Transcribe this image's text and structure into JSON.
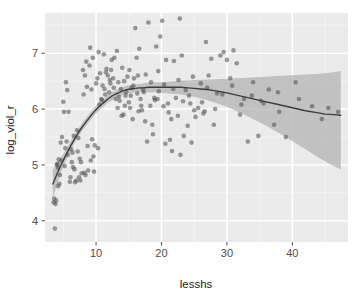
{
  "chart_data": {
    "type": "scatter",
    "title": "",
    "subtitle": "",
    "xlabel": "lesshs",
    "ylabel": "log_viol_r",
    "xlim": [
      2.2,
      48.5
    ],
    "ylim": [
      3.62,
      7.72
    ],
    "xticks": [
      10,
      20,
      30,
      40
    ],
    "xtick_labels": [
      "10",
      "20",
      "30",
      "40"
    ],
    "yticks": [
      4,
      5,
      6,
      7
    ],
    "ytick_labels": [
      "4",
      "5",
      "6",
      "7"
    ],
    "grid": true,
    "grid_major_color": "#ffffff",
    "grid_minor_color": "#f4f4f4",
    "panel_background": "#ebebeb",
    "legend": "none",
    "point_color": "#4d4d4d",
    "point_opacity": 0.55,
    "point_radius": 2.3,
    "smooth_line_color": "#3d3d3d",
    "smooth_band_color": "#b3b3b3",
    "smooth_band_opacity": 0.75,
    "series": [
      {
        "name": "observations",
        "x": [
          3.5,
          3.6,
          3.7,
          3.8,
          3.9,
          4.0,
          4.1,
          4.2,
          4.3,
          4.4,
          4.5,
          4.6,
          4.8,
          5.0,
          5.1,
          5.3,
          5.5,
          5.6,
          5.8,
          6.0,
          6.1,
          6.3,
          6.5,
          6.6,
          6.8,
          7.0,
          7.1,
          7.3,
          7.5,
          7.6,
          7.8,
          8.0,
          8.1,
          8.3,
          8.5,
          8.6,
          8.8,
          9.0,
          9.1,
          9.3,
          9.5,
          9.6,
          9.8,
          10.0,
          10.2,
          10.4,
          10.6,
          10.8,
          11.0,
          11.2,
          11.4,
          11.6,
          11.8,
          12.0,
          12.2,
          12.4,
          12.6,
          12.8,
          13.0,
          13.2,
          13.4,
          13.6,
          13.8,
          14.0,
          14.2,
          14.4,
          14.6,
          14.8,
          15.0,
          15.2,
          15.4,
          15.6,
          15.8,
          16.0,
          16.2,
          16.4,
          16.6,
          16.8,
          17.0,
          17.2,
          17.5,
          17.8,
          18.0,
          18.3,
          18.6,
          18.9,
          19.2,
          19.5,
          19.8,
          20.1,
          20.4,
          20.7,
          21.0,
          21.3,
          21.6,
          21.9,
          22.2,
          22.5,
          22.8,
          23.1,
          23.4,
          23.7,
          24.0,
          24.4,
          24.8,
          25.2,
          25.6,
          26.0,
          26.4,
          26.8,
          27.2,
          27.6,
          28.0,
          28.5,
          29.0,
          29.5,
          30.0,
          30.5,
          31.0,
          31.5,
          32.0,
          32.6,
          33.2,
          34.0,
          34.8,
          35.6,
          36.4,
          37.2,
          38.0,
          39.0,
          40.5,
          41.0,
          44.5,
          45.5,
          47.0,
          4.2,
          4.7,
          5.2,
          5.7,
          6.2,
          6.7,
          7.2,
          7.7,
          8.2,
          8.7,
          9.2,
          9.7,
          10.3,
          10.9,
          11.5,
          12.1,
          12.7,
          13.3,
          13.9,
          14.5,
          15.1,
          15.7,
          16.3,
          16.9,
          17.6,
          18.4,
          19.0,
          19.6,
          20.3,
          21.1,
          21.8,
          22.6,
          23.3,
          24.2,
          25.0,
          26.2,
          27.0,
          28.2,
          29.3,
          30.8,
          32.2,
          33.8,
          35.2,
          37.8,
          43.0,
          5.4,
          6.4,
          7.4,
          8.4,
          9.4,
          10.5,
          11.3,
          12.3,
          13.5,
          14.3,
          15.3,
          16.5,
          17.3,
          18.7,
          19.4,
          20.6,
          21.5,
          22.9,
          24.6,
          26.6
        ],
        "y": [
          4.33,
          4.4,
          3.86,
          4.3,
          4.36,
          5.0,
          5.02,
          4.95,
          5.1,
          4.66,
          4.82,
          5.4,
          5.5,
          6.13,
          5.95,
          5.3,
          5.42,
          6.34,
          5.95,
          4.7,
          4.78,
          5.05,
          4.96,
          5.52,
          4.69,
          4.72,
          5.62,
          5.48,
          5.11,
          4.72,
          4.85,
          6.7,
          6.26,
          6.6,
          6.85,
          6.4,
          4.9,
          6.78,
          7.1,
          6.35,
          6.92,
          5.15,
          5.35,
          6.46,
          6.55,
          7.02,
          6.64,
          6.18,
          6.42,
          6.98,
          6.26,
          6.72,
          6.6,
          6.3,
          6.46,
          6.88,
          6.55,
          6.92,
          6.18,
          7.04,
          6.48,
          6.15,
          6.36,
          6.74,
          5.9,
          6.06,
          6.3,
          6.58,
          6.12,
          6.02,
          6.38,
          5.82,
          6.55,
          7.45,
          6.92,
          6.6,
          7.08,
          6.18,
          5.98,
          6.35,
          5.78,
          5.42,
          7.55,
          6.06,
          5.72,
          6.2,
          7.12,
          6.68,
          7.3,
          7.58,
          6.44,
          6.88,
          6.1,
          5.45,
          5.25,
          6.86,
          6.2,
          5.88,
          7.62,
          6.96,
          5.52,
          6.34,
          5.7,
          6.1,
          6.58,
          5.86,
          6.02,
          6.46,
          5.92,
          7.2,
          6.6,
          6.9,
          5.72,
          6.28,
          6.96,
          7.02,
          6.88,
          6.55,
          7.05,
          6.82,
          5.9,
          6.18,
          5.42,
          6.48,
          5.52,
          6.1,
          6.35,
          5.72,
          5.95,
          5.5,
          6.48,
          6.18,
          5.82,
          6.02,
          5.95,
          4.62,
          5.08,
          4.98,
          5.18,
          5.28,
          4.92,
          5.24,
          5.05,
          4.86,
          5.34,
          5.08,
          4.88,
          5.3,
          6.16,
          6.66,
          6.52,
          6.38,
          6.02,
          5.88,
          6.24,
          6.7,
          6.42,
          6.28,
          6.06,
          6.62,
          6.48,
          6.16,
          6.32,
          6.05,
          5.94,
          6.36,
          6.52,
          6.14,
          6.24,
          5.98,
          6.12,
          6.38,
          6.0,
          6.26,
          6.42,
          6.08,
          6.24,
          6.15,
          6.3,
          6.05,
          6.48,
          5.22,
          4.78,
          4.82,
          5.46,
          6.08,
          6.36,
          6.7,
          6.22,
          6.5,
          6.24,
          5.96,
          6.3,
          5.55,
          6.18,
          5.38,
          5.82,
          5.18,
          5.4,
          5.96
        ]
      }
    ],
    "smooth": {
      "name": "loess-fit",
      "x": [
        3.4,
        4.0,
        4.6,
        5.2,
        5.8,
        6.4,
        7.0,
        7.6,
        8.2,
        8.8,
        9.4,
        10.0,
        10.6,
        11.2,
        11.8,
        12.4,
        13.0,
        13.6,
        14.2,
        14.8,
        15.4,
        16.0,
        16.6,
        17.2,
        18.0,
        19.0,
        20.0,
        21.0,
        22.0,
        23.0,
        24.0,
        25.0,
        26.0,
        27.0,
        28.0,
        29.0,
        30.0,
        31.5,
        33.0,
        34.5,
        36.0,
        37.5,
        39.0,
        40.5,
        42.0,
        43.5,
        45.0,
        46.3,
        47.4
      ],
      "y": [
        4.66,
        4.83,
        4.99,
        5.13,
        5.27,
        5.4,
        5.52,
        5.63,
        5.73,
        5.82,
        5.91,
        5.99,
        6.06,
        6.12,
        6.18,
        6.23,
        6.27,
        6.3,
        6.33,
        6.35,
        6.36,
        6.37,
        6.38,
        6.38,
        6.39,
        6.39,
        6.39,
        6.39,
        6.39,
        6.39,
        6.38,
        6.37,
        6.36,
        6.35,
        6.33,
        6.31,
        6.29,
        6.25,
        6.21,
        6.17,
        6.13,
        6.09,
        6.05,
        6.01,
        5.97,
        5.94,
        5.91,
        5.9,
        5.89
      ],
      "ci_lower": [
        4.4,
        4.64,
        4.85,
        5.02,
        5.18,
        5.32,
        5.45,
        5.56,
        5.66,
        5.75,
        5.84,
        5.92,
        5.99,
        6.05,
        6.11,
        6.16,
        6.2,
        6.23,
        6.26,
        6.28,
        6.29,
        6.3,
        6.3,
        6.3,
        6.3,
        6.3,
        6.29,
        6.28,
        6.27,
        6.26,
        6.24,
        6.22,
        6.19,
        6.16,
        6.12,
        6.08,
        6.04,
        5.96,
        5.88,
        5.79,
        5.7,
        5.6,
        5.5,
        5.39,
        5.28,
        5.17,
        5.06,
        4.98,
        4.92
      ],
      "ci_upper": [
        4.92,
        5.02,
        5.13,
        5.24,
        5.36,
        5.48,
        5.59,
        5.7,
        5.8,
        5.89,
        5.98,
        6.06,
        6.13,
        6.19,
        6.25,
        6.3,
        6.34,
        6.37,
        6.4,
        6.42,
        6.43,
        6.44,
        6.45,
        6.46,
        6.47,
        6.48,
        6.48,
        6.49,
        6.5,
        6.51,
        6.51,
        6.52,
        6.52,
        6.53,
        6.53,
        6.54,
        6.54,
        6.55,
        6.56,
        6.57,
        6.58,
        6.59,
        6.6,
        6.61,
        6.62,
        6.63,
        6.64,
        6.66,
        6.68
      ]
    }
  }
}
